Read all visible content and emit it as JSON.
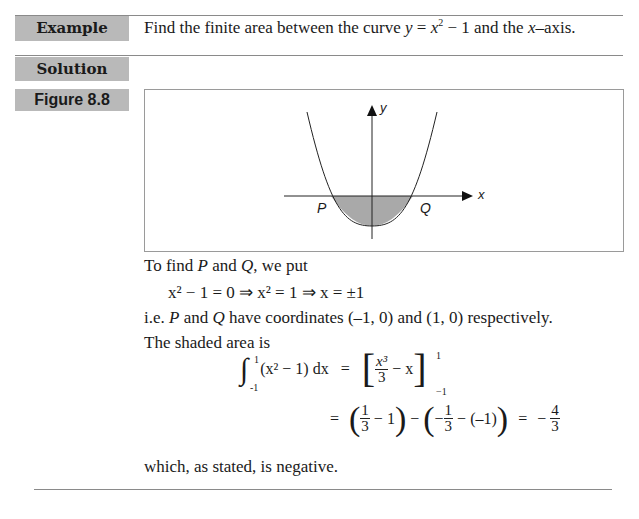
{
  "example": {
    "label": "Example",
    "question_prefix": "Find the finite area between the curve ",
    "question_curve_y": "y",
    "question_curve_eq": " = ",
    "question_curve_x": "x",
    "question_curve_exp": "2",
    "question_curve_rest": " − 1 and the ",
    "question_axis_x": "x",
    "question_suffix": "–axis."
  },
  "solution": {
    "label": "Solution"
  },
  "figure": {
    "label": "Figure 8.8",
    "y_axis_label": "y",
    "x_axis_label": "x",
    "point_left": "P",
    "point_right": "Q",
    "shade_color": "#a9a9a9"
  },
  "body": {
    "line1_a": "To find ",
    "line1_p": "P",
    "line1_b": " and ",
    "line1_q": "Q",
    "line1_c": ", we put",
    "eq1": "x² − 1 = 0  ⇒  x² = 1  ⇒  x = ±1",
    "line3_a": "i.e. ",
    "line3_p": "P",
    "line3_b": " and ",
    "line3_q": "Q",
    "line3_c": " have coordinates (–1, 0) and (1, 0) respectively.",
    "line4": "The shaded area  is",
    "integral": {
      "upper": "1",
      "lower": "-1",
      "integrand": "(x² − 1) dx",
      "equals": "=",
      "frac_num": "x³",
      "frac_den": "3",
      "bracket_rest": "− x",
      "limit_upper": "1",
      "limit_lower": "−1"
    },
    "result": {
      "equals": "=",
      "f1_num": "1",
      "f1_den": "3",
      "term1_rest": "−  1",
      "minus": "−",
      "neg": "−",
      "f2_num": "1",
      "f2_den": "3",
      "term2_rest": "− (–1)",
      "equals2": "=",
      "neg2": "−",
      "f3_num": "4",
      "f3_den": "3"
    },
    "conclusion": "which, as stated, is negative."
  }
}
